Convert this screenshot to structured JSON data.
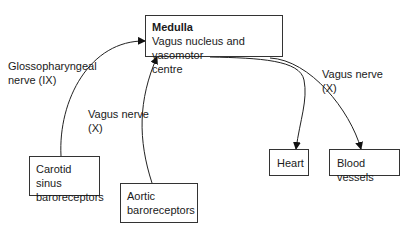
{
  "nodes": {
    "medulla": {
      "title": "Medulla",
      "line1": "Vagus nucleus and vasomotor",
      "line2": "centre"
    },
    "carotid": {
      "line1": "Carotid sinus",
      "line2": "baroreceptors"
    },
    "aortic": {
      "line1": "Aortic",
      "line2": "baroreceptors"
    },
    "heart": {
      "line1": "Heart"
    },
    "vessels": {
      "line1": "Blood vessels"
    }
  },
  "edges": {
    "glosso": {
      "line1": "Glossopharyngeal",
      "line2": "nerve (IX)"
    },
    "vagus_in": {
      "line1": "Vagus nerve",
      "line2": "(X)"
    },
    "vagus_out": {
      "line1": "Vagus nerve",
      "line2": "(X)"
    }
  }
}
